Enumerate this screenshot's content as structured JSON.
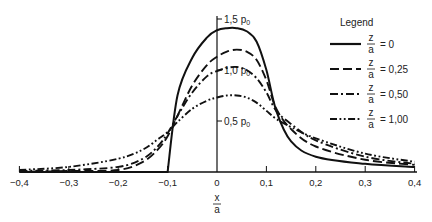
{
  "chart_data": {
    "type": "line",
    "title": "",
    "xlabel": "x/a",
    "ylabel": "",
    "xlim": [
      -0.4,
      0.4
    ],
    "ylim": [
      0,
      1.5
    ],
    "y_unit": "p0",
    "grid": false,
    "legend_position": "upper right",
    "legend_title": "Legend",
    "x_ticks": [
      "-0.4",
      "-0.3",
      "-0.2",
      "-0.1",
      "0",
      "0.1",
      "0.2",
      "0.3",
      "0.4"
    ],
    "y_ticks": [
      "0.5 p0",
      "1.0 p0",
      "1.5 p0"
    ],
    "x": [
      -0.4,
      -0.3,
      -0.2,
      -0.15,
      -0.12,
      -0.1,
      -0.08,
      -0.05,
      -0.02,
      0,
      0.02,
      0.04,
      0.06,
      0.08,
      0.1,
      0.12,
      0.15,
      0.2,
      0.3,
      0.4
    ],
    "series": [
      {
        "name": "z/a = 0",
        "style": "solid",
        "values": [
          0,
          0,
          0,
          0,
          0,
          0,
          0.75,
          1.12,
          1.32,
          1.39,
          1.41,
          1.41,
          1.38,
          1.28,
          1.0,
          0.6,
          0.3,
          0.15,
          0.08,
          0.05
        ]
      },
      {
        "name": "z/a = 0.25",
        "style": "dashed",
        "values": [
          0,
          0.01,
          0.02,
          0.1,
          0.22,
          0.35,
          0.55,
          0.85,
          1.05,
          1.13,
          1.18,
          1.2,
          1.18,
          1.1,
          0.9,
          0.62,
          0.42,
          0.25,
          0.12,
          0.07
        ]
      },
      {
        "name": "z/a = 0.50",
        "style": "dash-dot",
        "values": [
          0.01,
          0.02,
          0.05,
          0.13,
          0.25,
          0.38,
          0.55,
          0.78,
          0.94,
          0.99,
          1.02,
          1.03,
          1.0,
          0.92,
          0.78,
          0.6,
          0.47,
          0.31,
          0.15,
          0.08
        ]
      },
      {
        "name": "z/a = 1.00",
        "style": "dash-dot-dot",
        "values": [
          0.02,
          0.05,
          0.13,
          0.22,
          0.32,
          0.39,
          0.49,
          0.62,
          0.7,
          0.73,
          0.75,
          0.75,
          0.73,
          0.68,
          0.6,
          0.52,
          0.44,
          0.33,
          0.18,
          0.1
        ]
      }
    ],
    "annotations": [
      "1.5 p0",
      "1.0 p0",
      "0.5 p0"
    ]
  },
  "legend": {
    "title": "Legend",
    "items": [
      {
        "num": "z",
        "den": "a",
        "value": "= 0"
      },
      {
        "num": "z",
        "den": "a",
        "value": "= 0.25"
      },
      {
        "num": "z",
        "den": "a",
        "value": "= 0.50"
      },
      {
        "num": "z",
        "den": "a",
        "value": "= 1.00"
      }
    ]
  },
  "axis": {
    "x_label_num": "x",
    "x_label_den": "a",
    "y_labels": [
      "1.5 p",
      "1.0 p",
      "0.5 p"
    ],
    "y_sub": "0"
  }
}
